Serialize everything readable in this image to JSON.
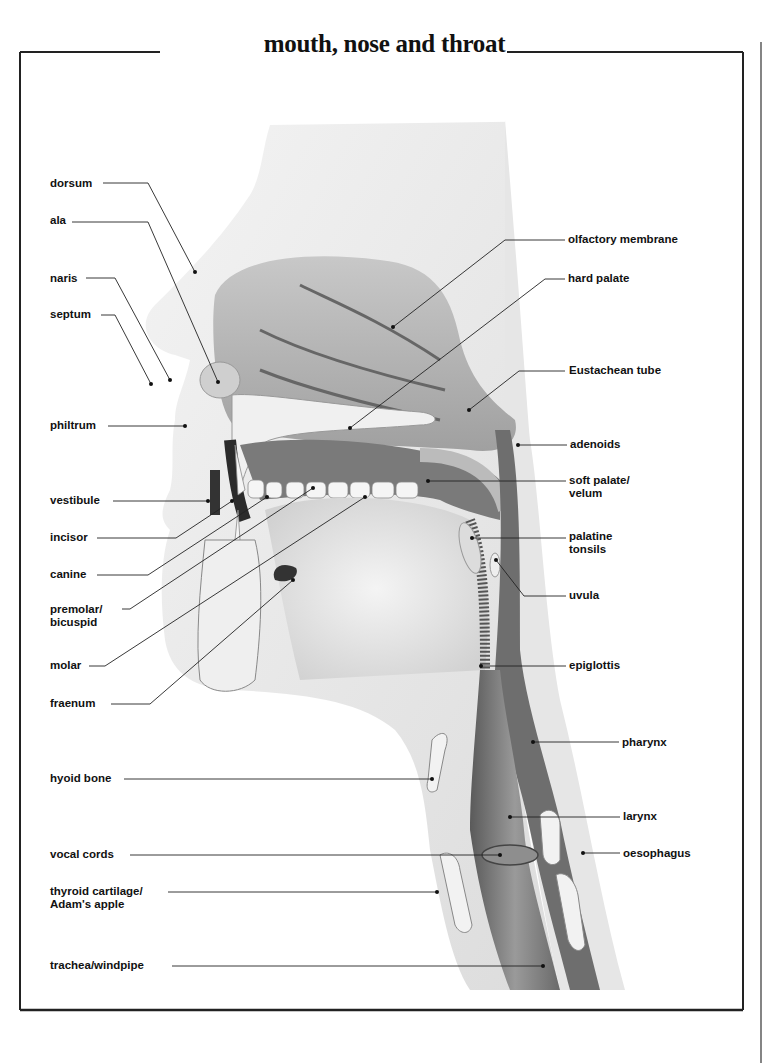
{
  "title": "mouth, nose and throat",
  "labels_left": [
    {
      "id": "dorsum",
      "text": "dorsum",
      "x": 50,
      "y": 177
    },
    {
      "id": "ala",
      "text": "ala",
      "x": 50,
      "y": 214
    },
    {
      "id": "naris",
      "text": "naris",
      "x": 50,
      "y": 273
    },
    {
      "id": "septum",
      "text": "septum",
      "x": 50,
      "y": 308
    },
    {
      "id": "philtrum",
      "text": "philtrum",
      "x": 50,
      "y": 419
    },
    {
      "id": "vestibule",
      "text": "vestibule",
      "x": 50,
      "y": 490
    },
    {
      "id": "incisor",
      "text": "incisor",
      "x": 50,
      "y": 527
    },
    {
      "id": "canine",
      "text": "canine",
      "x": 50,
      "y": 564
    },
    {
      "id": "premolar",
      "text": "premolar/\nbicuspid",
      "x": 50,
      "y": 600
    },
    {
      "id": "molar",
      "text": "molar",
      "x": 50,
      "y": 656
    },
    {
      "id": "fraenum",
      "text": "fraenum",
      "x": 50,
      "y": 693
    },
    {
      "id": "hyoid",
      "text": "hyoid bone",
      "x": 50,
      "y": 768
    },
    {
      "id": "vocal",
      "text": "vocal cords",
      "x": 50,
      "y": 844
    },
    {
      "id": "thyroid",
      "text": "thyroid cartilage/\nAdam's apple",
      "x": 50,
      "y": 881
    },
    {
      "id": "trachea",
      "text": "trachea/windpipe",
      "x": 50,
      "y": 955
    }
  ],
  "labels_right": [
    {
      "id": "olfactory",
      "text": "olfactory membrane",
      "x": 568,
      "y": 229
    },
    {
      "id": "hard-palate",
      "text": "hard palate",
      "x": 568,
      "y": 266
    },
    {
      "id": "eustachean",
      "text": "Eustachean tube",
      "x": 569,
      "y": 360
    },
    {
      "id": "adenoids",
      "text": "adenoids",
      "x": 570,
      "y": 433
    },
    {
      "id": "soft-palate",
      "text": "soft palate/\nvelum",
      "x": 569,
      "y": 470
    },
    {
      "id": "tonsils",
      "text": "palatine\ntonsils",
      "x": 569,
      "y": 525
    },
    {
      "id": "uvula",
      "text": "uvula",
      "x": 569,
      "y": 583
    },
    {
      "id": "epiglottis",
      "text": "epiglottis",
      "x": 569,
      "y": 656
    },
    {
      "id": "pharynx",
      "text": "pharynx",
      "x": 622,
      "y": 733
    },
    {
      "id": "larynx",
      "text": "larynx",
      "x": 623,
      "y": 807
    },
    {
      "id": "oesophagus",
      "text": "oesophagus",
      "x": 623,
      "y": 845
    }
  ],
  "colors": {
    "ink": "#111111",
    "skin": "#dcdcdc",
    "cavity": "#8a8a8a",
    "dark": "#3a3a3a",
    "bone": "#efefef"
  }
}
